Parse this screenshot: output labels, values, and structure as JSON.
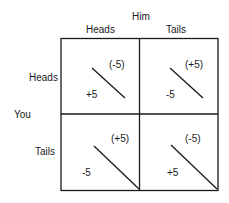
{
  "matrix": {
    "column_player": "Him",
    "row_player": "You",
    "columns": [
      "Heads",
      "Tails"
    ],
    "rows": [
      "Heads",
      "Tails"
    ],
    "cells": [
      [
        {
          "you": "+5",
          "him": "(-5)"
        },
        {
          "you": "-5",
          "him": "(+5)"
        }
      ],
      [
        {
          "you": "-5",
          "him": "(+5)"
        },
        {
          "you": "+5",
          "him": "(-5)"
        }
      ]
    ]
  }
}
